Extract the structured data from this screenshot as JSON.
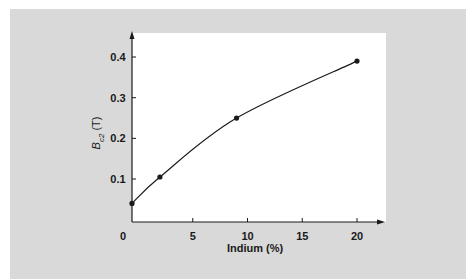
{
  "chart_data": {
    "type": "line",
    "title": "",
    "xlabel": "Indium (%)",
    "ylabel": "B_c2 (T)",
    "ylabel_parts": {
      "symbol": "B",
      "subscript": "c2",
      "unit": "(T)"
    },
    "x_ticks": [
      "0",
      "5",
      "10",
      "15",
      "20"
    ],
    "y_ticks": [
      "0.1",
      "0.2",
      "0.3",
      "0.4"
    ],
    "xlim": [
      0,
      22
    ],
    "ylim": [
      0,
      0.45
    ],
    "grid": false,
    "legend": null,
    "series": [
      {
        "name": "B_c2 vs Indium",
        "x": [
          0,
          2,
          9,
          20
        ],
        "y": [
          0.04,
          0.105,
          0.25,
          0.39
        ],
        "markers": true,
        "smooth_curve": true
      }
    ]
  },
  "colors": {
    "panel_background": "#d9d9d9",
    "plot_background": "#ffffff",
    "line": "#1a1a1a"
  }
}
